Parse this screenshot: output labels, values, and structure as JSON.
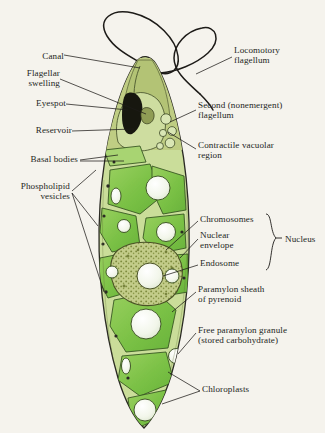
{
  "figure": {
    "background_color": "#f5f3ed",
    "line_color": "#1d1b18"
  },
  "colors": {
    "chloroplast_green": "#7cc24a",
    "chloroplast_green_light": "#a6d47a",
    "cytoplasm_pale": "#cfdfa4",
    "apex_olive": "#b9c87f",
    "granule_white": "#f4f7ee",
    "nucleus_stipple": "#b3c077",
    "eyespot_black": "#1a1a16",
    "outline": "#2b2a24"
  },
  "labels_left": [
    {
      "id": "canal",
      "text": "Canal",
      "x": 34,
      "y": 57
    },
    {
      "id": "flagellar-swelling",
      "text": "Flagellar\nswelling",
      "x": 18,
      "y": 74
    },
    {
      "id": "eyespot",
      "text": "Eyespot",
      "x": 22,
      "y": 103
    },
    {
      "id": "reservoir",
      "text": "Reservoir",
      "x": 14,
      "y": 130
    },
    {
      "id": "basal-bodies",
      "text": "Basal bodies",
      "x": 6,
      "y": 157
    },
    {
      "id": "phospholipid-vesicles",
      "text": "Phospholipid\nvesicles",
      "x": 2,
      "y": 186
    }
  ],
  "labels_right": [
    {
      "id": "locomotory-flagellum",
      "text": "Locomotory\nflagellum",
      "x": 234,
      "y": 50
    },
    {
      "id": "second-flagellum",
      "text": "Second (nonemergent)\nflagellum",
      "x": 198,
      "y": 105
    },
    {
      "id": "contractile-vacuolar-region",
      "text": "Contractile vacuolar\nregion",
      "x": 198,
      "y": 144
    },
    {
      "id": "chromosomes",
      "text": "Chromosomes",
      "x": 200,
      "y": 218
    },
    {
      "id": "nuclear-envelope",
      "text": "Nuclear\nenvelope",
      "x": 200,
      "y": 234
    },
    {
      "id": "endosome",
      "text": "Endosome",
      "x": 200,
      "y": 262
    },
    {
      "id": "paramylon-sheath",
      "text": "Paramylon sheath\nof pyrenoid",
      "x": 198,
      "y": 288
    },
    {
      "id": "free-paramylon-granule",
      "text": "Free paramylon granule\n(stored carbohydrate)",
      "x": 198,
      "y": 329
    },
    {
      "id": "chloroplasts",
      "text": "Chloroplasts",
      "x": 202,
      "y": 388
    }
  ],
  "group_label": {
    "id": "nucleus",
    "text": "Nucleus",
    "x": 285,
    "y": 240
  }
}
